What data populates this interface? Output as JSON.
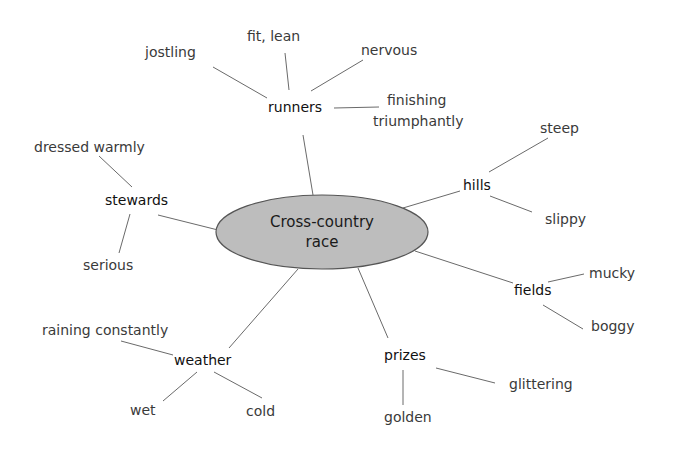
{
  "diagram": {
    "type": "mind-map",
    "center": {
      "label_line1": "Cross-country",
      "label_line2": "race",
      "fill": "#bdbdbd",
      "stroke": "#555555"
    },
    "branches": {
      "runners": {
        "label": "runners",
        "leaves": {
          "jostling": "jostling",
          "fit_lean": "fit, lean",
          "nervous": "nervous",
          "finishing_1": "finishing",
          "finishing_2": "triumphantly"
        }
      },
      "hills": {
        "label": "hills",
        "leaves": {
          "steep": "steep",
          "slippy": "slippy"
        }
      },
      "fields": {
        "label": "fields",
        "leaves": {
          "mucky": "mucky",
          "boggy": "boggy"
        }
      },
      "prizes": {
        "label": "prizes",
        "leaves": {
          "glittering": "glittering",
          "golden": "golden"
        }
      },
      "weather": {
        "label": "weather",
        "leaves": {
          "raining": "raining constantly",
          "wet": "wet",
          "cold": "cold"
        }
      },
      "stewards": {
        "label": "stewards",
        "leaves": {
          "dressed": "dressed warmly",
          "serious": "serious"
        }
      }
    },
    "line_color": "#6a6a6a"
  }
}
